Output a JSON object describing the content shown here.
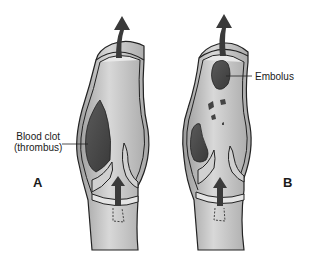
{
  "figure": {
    "panels": [
      {
        "id": "A",
        "letter": "A",
        "annotation_line1": "Blood clot",
        "annotation_line2": "(thrombus)"
      },
      {
        "id": "B",
        "letter": "B",
        "annotation": "Embolus"
      }
    ],
    "colors": {
      "vessel_wall": "#cfcfcf",
      "vessel_outline": "#2a2a2a",
      "lumen": "#b5b5b5",
      "clot": "#4a4a4a",
      "arrow": "#3a3a3a",
      "background": "#ffffff"
    }
  }
}
